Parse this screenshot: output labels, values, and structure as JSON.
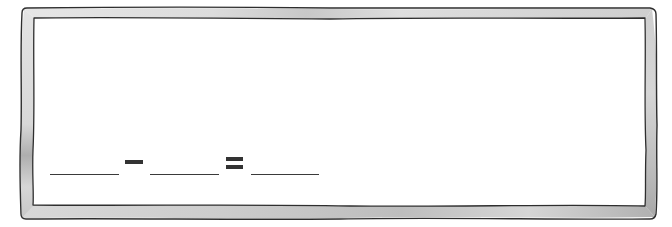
{
  "worksheet": {
    "type": "subtraction-fill-in",
    "frame": {
      "style": "hand-drawn watercolor border",
      "fill_color": "#e2e2e2",
      "shadow_color": "#b8b8b8",
      "outline_color": "#2e2e2e",
      "background_color": "#ffffff"
    },
    "equation": {
      "operand_1": "",
      "operator": "−",
      "operand_2": "",
      "equals": "=",
      "result": ""
    }
  }
}
